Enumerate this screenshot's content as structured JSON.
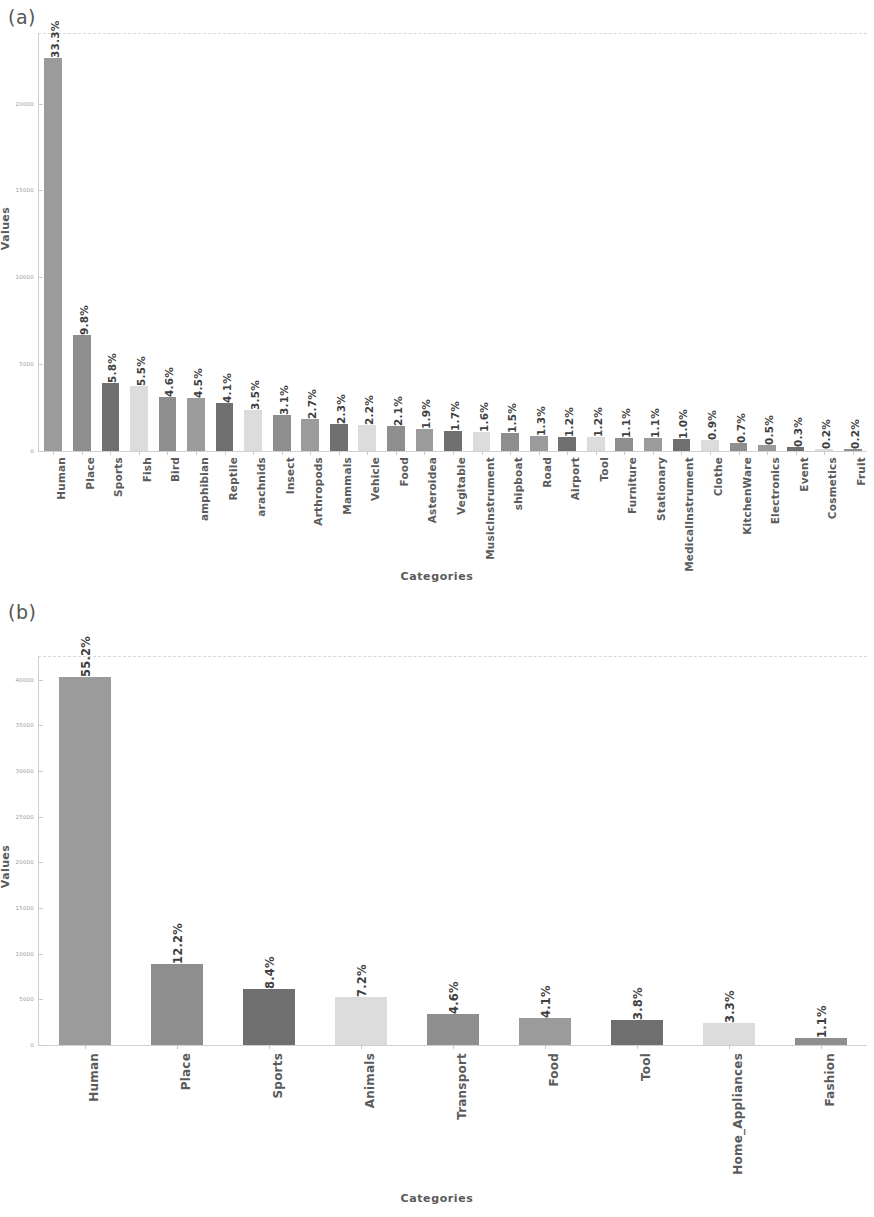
{
  "figure": {
    "panels": [
      {
        "tag": "(a)"
      },
      {
        "tag": "(b)"
      }
    ]
  },
  "axis_titles": {
    "a_y": "Values",
    "a_x": "Categories",
    "b_y": "Values",
    "b_x": "Categories"
  },
  "chart_data": [
    {
      "type": "bar",
      "title": "(a)",
      "xlabel": "Categories",
      "ylabel": "Values",
      "ylim": [
        0,
        24000
      ],
      "grid": false,
      "legend": "none",
      "yticks": [
        0,
        5000,
        10000,
        15000,
        20000
      ],
      "ytick_labels": [
        "0",
        "5000",
        "10000",
        "15000",
        "20000"
      ],
      "categories": [
        "Human",
        "Place",
        "Sports",
        "Fish",
        "Bird",
        "amphibian",
        "Reptile",
        "arachnids",
        "Insect",
        "Arthropods",
        "Mammals",
        "Vehicle",
        "Food",
        "Asteroidea",
        "Vegitable",
        "MusicInstrument",
        "shipboat",
        "Road",
        "Airport",
        "Tool",
        "Furniture",
        "Stationary",
        "MedicalInstrument",
        "Clothe",
        "KitchenWare",
        "Electronics",
        "Event",
        "Cosmetics",
        "Fruit"
      ],
      "data_labels": [
        "33.3%",
        "9.8%",
        "5.8%",
        "5.5%",
        "4.6%",
        "4.5%",
        "4.1%",
        "3.5%",
        "3.1%",
        "2.7%",
        "2.3%",
        "2.2%",
        "2.1%",
        "1.9%",
        "1.7%",
        "1.6%",
        "1.5%",
        "1.3%",
        "1.2%",
        "1.2%",
        "1.1%",
        "1.1%",
        "1.0%",
        "0.9%",
        "0.7%",
        "0.5%",
        "0.3%",
        "0.2%",
        "0.2%"
      ],
      "percentages": [
        33.3,
        9.8,
        5.8,
        5.5,
        4.6,
        4.5,
        4.1,
        3.5,
        3.1,
        2.7,
        2.3,
        2.2,
        2.1,
        1.9,
        1.7,
        1.6,
        1.5,
        1.3,
        1.2,
        1.2,
        1.1,
        1.1,
        1.0,
        0.9,
        0.7,
        0.5,
        0.3,
        0.2,
        0.2
      ],
      "values": [
        22600,
        6650,
        3940,
        3730,
        3120,
        3050,
        2780,
        2380,
        2100,
        1830,
        1560,
        1490,
        1425,
        1290,
        1150,
        1085,
        1020,
        880,
        815,
        815,
        745,
        745,
        680,
        610,
        475,
        340,
        205,
        135,
        135
      ],
      "bar_colors": [
        "#9b9b9b",
        "#8e8e8e",
        "#6f6f6f",
        "#dcdcdc",
        "#8e8e8e",
        "#9b9b9b",
        "#6f6f6f",
        "#dcdcdc",
        "#8e8e8e",
        "#9b9b9b",
        "#6f6f6f",
        "#dcdcdc",
        "#8e8e8e",
        "#9b9b9b",
        "#6f6f6f",
        "#dcdcdc",
        "#8e8e8e",
        "#9b9b9b",
        "#6f6f6f",
        "#dcdcdc",
        "#8e8e8e",
        "#9b9b9b",
        "#6f6f6f",
        "#dcdcdc",
        "#8e8e8e",
        "#9b9b9b",
        "#6f6f6f",
        "#dcdcdc",
        "#8e8e8e"
      ]
    },
    {
      "type": "bar",
      "title": "(b)",
      "xlabel": "Categories",
      "ylabel": "Values",
      "ylim": [
        0,
        42500
      ],
      "grid": false,
      "legend": "none",
      "yticks": [
        0,
        5000,
        10000,
        15000,
        20000,
        25000,
        30000,
        35000,
        40000
      ],
      "ytick_labels": [
        "0",
        "5000",
        "10000",
        "15000",
        "20000",
        "25000",
        "30000",
        "35000",
        "40000"
      ],
      "categories": [
        "Human",
        "Place",
        "Sports",
        "Animals",
        "Transport",
        "Food",
        "Tool",
        "Home_Appliances",
        "Fashion"
      ],
      "data_labels": [
        "55.2%",
        "12.2%",
        "8.4%",
        "7.2%",
        "4.6%",
        "4.1%",
        "3.8%",
        "3.3%",
        "1.1%"
      ],
      "percentages": [
        55.2,
        12.2,
        8.4,
        7.2,
        4.6,
        4.1,
        3.8,
        3.3,
        1.1
      ],
      "values": [
        40300,
        8900,
        6130,
        5250,
        3360,
        2990,
        2770,
        2410,
        800
      ],
      "bar_colors": [
        "#9b9b9b",
        "#8e8e8e",
        "#6f6f6f",
        "#dcdcdc",
        "#8e8e8e",
        "#9b9b9b",
        "#6f6f6f",
        "#dcdcdc",
        "#8e8e8e"
      ]
    }
  ]
}
